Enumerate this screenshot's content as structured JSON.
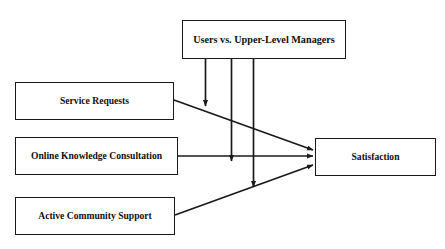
{
  "diagram": {
    "type": "research-model-path-diagram",
    "background_color": "#ffffff",
    "line_color": "#1a1a1a",
    "text_color": "#100f0f",
    "moderator": {
      "id": "users-vs-upper-level-managers",
      "label": "Users vs. Upper-Level Managers",
      "role": "moderator"
    },
    "antecedents": [
      {
        "id": "service-requests",
        "label": "Service Requests",
        "role": "independent-variable"
      },
      {
        "id": "online-knowledge-consultation",
        "label": "Online Knowledge Consultation",
        "role": "independent-variable"
      },
      {
        "id": "active-community-support",
        "label": "Active Community Support",
        "role": "independent-variable"
      }
    ],
    "outcome": {
      "id": "satisfaction",
      "label": "Satisfaction",
      "role": "dependent-variable"
    },
    "paths": [
      {
        "id": "path-service-requests-to-satisfaction",
        "from": "service-requests",
        "to": "satisfaction",
        "shape": "diagonal-descending"
      },
      {
        "id": "path-online-knowledge-to-satisfaction",
        "from": "online-knowledge-consultation",
        "to": "satisfaction",
        "shape": "horizontal"
      },
      {
        "id": "path-active-community-to-satisfaction",
        "from": "active-community-support",
        "to": "satisfaction",
        "shape": "diagonal-ascending"
      }
    ],
    "moderation_arrows": [
      {
        "id": "moderation-onto-service-requests-path",
        "from": "users-vs-upper-level-managers",
        "targets_path": "path-service-requests-to-satisfaction"
      },
      {
        "id": "moderation-onto-online-knowledge-path",
        "from": "users-vs-upper-level-managers",
        "targets_path": "path-online-knowledge-to-satisfaction"
      },
      {
        "id": "moderation-onto-active-community-path",
        "from": "users-vs-upper-level-managers",
        "targets_path": "path-active-community-to-satisfaction"
      }
    ]
  }
}
